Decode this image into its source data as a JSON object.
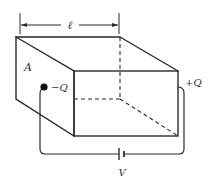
{
  "figure": {
    "labels": {
      "length": "ℓ",
      "area": "A",
      "negative_charge": "−Q",
      "positive_charge": "+Q",
      "voltage": "V"
    },
    "colors": {
      "line": "#2a2a2a",
      "text": "#333333",
      "background": "#ffffff"
    }
  }
}
